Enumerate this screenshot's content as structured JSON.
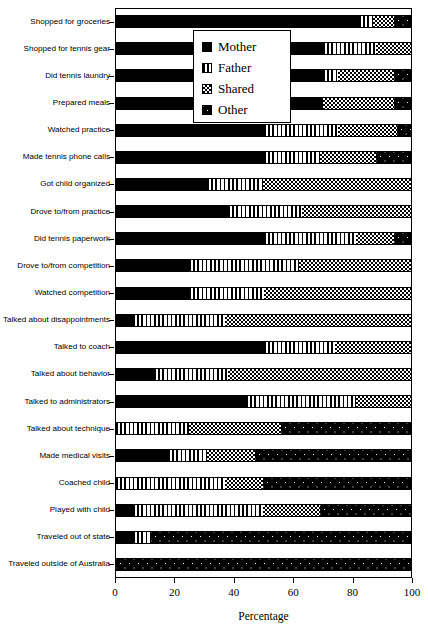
{
  "chart_data": {
    "type": "bar",
    "orientation": "horizontal",
    "stacked": true,
    "title": "",
    "xlabel": "Percentage",
    "ylabel": "",
    "xlim": [
      0,
      100
    ],
    "xticks": [
      0,
      20,
      40,
      60,
      80,
      100
    ],
    "xtick_labels": [
      "0",
      "20",
      "40",
      "60",
      "80",
      "100"
    ],
    "grid": false,
    "legend_position": "top-center-inside",
    "series": [
      {
        "name": "Mother",
        "pattern": "solid-black",
        "color": "#000000",
        "values": [
          82,
          70,
          70,
          70,
          50,
          50,
          31,
          38,
          50,
          25,
          25,
          6,
          50,
          13,
          44,
          0,
          18,
          0,
          6,
          6,
          0
        ]
      },
      {
        "name": "Father",
        "pattern": "vertical-stripes",
        "color": "#ffffff",
        "values": [
          5,
          18,
          5,
          0,
          25,
          19,
          19,
          25,
          31,
          37,
          25,
          31,
          24,
          25,
          37,
          25,
          13,
          37,
          44,
          6,
          0
        ]
      },
      {
        "name": "Shared",
        "pattern": "checkerboard",
        "color": "#808080",
        "values": [
          7,
          12,
          19,
          24,
          20,
          19,
          50,
          37,
          13,
          38,
          50,
          63,
          26,
          62,
          19,
          31,
          16,
          13,
          19,
          0,
          0
        ]
      },
      {
        "name": "Other",
        "pattern": "dotted-dark",
        "color": "#1a1a1a",
        "values": [
          6,
          0,
          6,
          6,
          5,
          12,
          0,
          0,
          6,
          0,
          0,
          0,
          0,
          0,
          0,
          44,
          53,
          50,
          31,
          88,
          100
        ]
      }
    ],
    "categories": [
      "Shopped for groceries",
      "Shopped for tennis gear",
      "Did tennis laundry",
      "Prepared meals",
      "Watched practice",
      "Made tennis phone calls",
      "Got child organized",
      "Drove to/from practice",
      "Did tennis paperwork",
      "Drove to/from competition",
      "Watched competition",
      "Talked about disappointments",
      "Talked to coach",
      "Talked about behavior",
      "Talked to administrators",
      "Talked about technique",
      "Made medical visits",
      "Coached child",
      "Played with child",
      "Traveled out of state",
      "Traveled outside of Australia"
    ],
    "legend": [
      {
        "label": "Mother",
        "pattern": "solid-black"
      },
      {
        "label": "Father",
        "pattern": "vertical-stripes"
      },
      {
        "label": "Shared",
        "pattern": "checkerboard"
      },
      {
        "label": "Other",
        "pattern": "dotted-dark"
      }
    ]
  }
}
